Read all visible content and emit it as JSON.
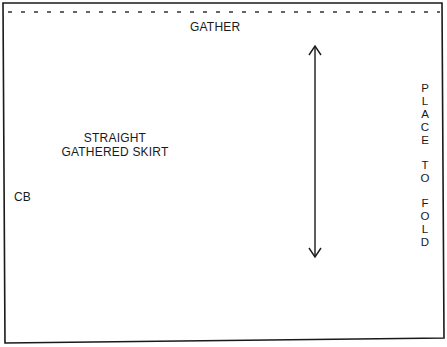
{
  "pattern": {
    "title_line1": "STRAIGHT",
    "title_line2": "GATHERED SKIRT",
    "top_edge_label": "GATHER",
    "left_edge_label": "CB",
    "fold_label_letters": [
      "P",
      "L",
      "A",
      "C",
      "E",
      "",
      "T",
      "O",
      "",
      "F",
      "O",
      "L",
      "D"
    ],
    "fold_label": "PLACE TO FOLD",
    "grainline": "double-headed vertical arrow",
    "colors": {
      "line": "#1a1a1a",
      "background": "#ffffff"
    }
  }
}
